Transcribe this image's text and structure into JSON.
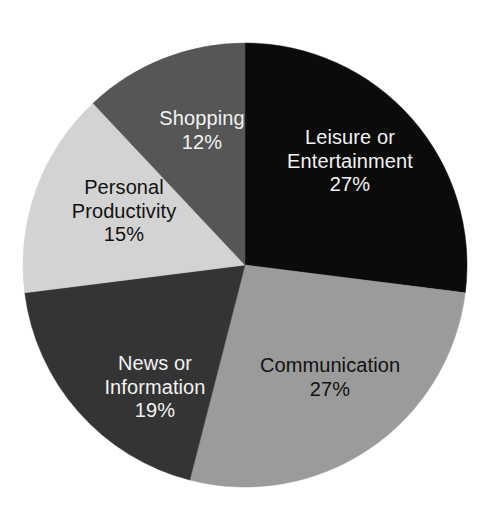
{
  "chart_data": {
    "type": "pie",
    "title": "",
    "subtitle": "",
    "xlabel": "",
    "ylabel": "",
    "legend": "none",
    "grid": false,
    "value_unit": "%",
    "total": 100,
    "start_angle_deg": 0,
    "direction": "clockwise",
    "categories": [
      "Leisure or Entertainment",
      "Communication",
      "News or Information",
      "Personal Productivity",
      "Shopping"
    ],
    "values": [
      27,
      27,
      19,
      15,
      12
    ],
    "slices": [
      {
        "key": "leisure",
        "label_line1": "Leisure or",
        "label_line2": "Entertainment",
        "label_full": "Leisure or Entertainment",
        "value": 27,
        "value_text": "27%",
        "color": "#0b0b0b",
        "text_color": "#f2f2f2",
        "text_tone": "light",
        "start_deg": 0,
        "end_deg": 97.2
      },
      {
        "key": "communication",
        "label_line1": "Communication",
        "label_line2": "",
        "label_full": "Communication",
        "value": 27,
        "value_text": "27%",
        "color": "#9b9b9b",
        "text_color": "#111111",
        "text_tone": "dark",
        "start_deg": 97.2,
        "end_deg": 194.4
      },
      {
        "key": "news",
        "label_line1": "News or",
        "label_line2": "Information",
        "label_full": "News or Information",
        "value": 19,
        "value_text": "19%",
        "color": "#343434",
        "text_color": "#f2f2f2",
        "text_tone": "light",
        "start_deg": 194.4,
        "end_deg": 262.8
      },
      {
        "key": "productivity",
        "label_line1": "Personal",
        "label_line2": "Productivity",
        "label_full": "Personal Productivity",
        "value": 15,
        "value_text": "15%",
        "color": "#d3d3d3",
        "text_color": "#111111",
        "text_tone": "dark",
        "start_deg": 262.8,
        "end_deg": 316.8
      },
      {
        "key": "shopping",
        "label_line1": "Shopping",
        "label_line2": "",
        "label_full": "Shopping",
        "value": 12,
        "value_text": "12%",
        "color": "#565656",
        "text_color": "#f2f2f2",
        "text_tone": "light",
        "start_deg": 316.8,
        "end_deg": 360
      }
    ],
    "geometry": {
      "center_x": 245,
      "center_y": 265,
      "radius": 222
    },
    "background_color": "#ffffff"
  }
}
